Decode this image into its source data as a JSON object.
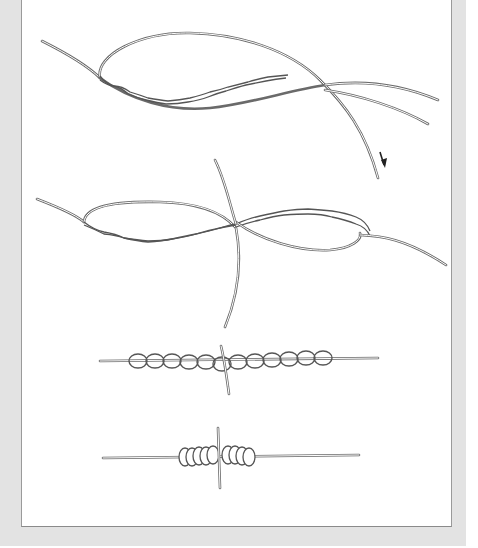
{
  "figure": {
    "type": "knot-tying-instructions",
    "steps": [
      {
        "id": 1,
        "name": "overlap-and-twist",
        "arrow": "pull-down"
      },
      {
        "id": 2,
        "name": "tuck-ends-through-center"
      },
      {
        "id": 3,
        "name": "wraps-formed-loose"
      },
      {
        "id": 4,
        "name": "knot-tightened"
      }
    ]
  },
  "colors": {
    "frame": "#e3e3e3",
    "panel": "#ffffff",
    "line": "#6a6a6a",
    "arrow": "#222222"
  }
}
